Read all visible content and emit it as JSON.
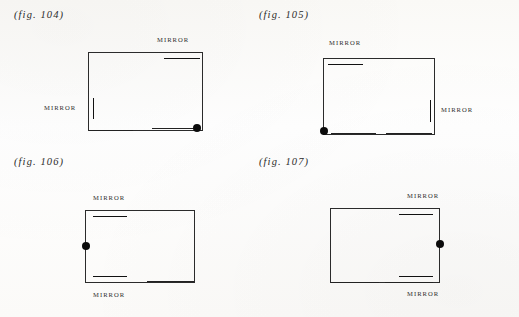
{
  "page": {
    "background_color": "#fdfdfc",
    "ink_color": "#1a1a1a"
  },
  "figures": [
    {
      "id": "fig-104",
      "label": "(fig. 104)",
      "mirrors": [
        {
          "label": "MIRROR",
          "wall": "top",
          "side": "right"
        },
        {
          "label": "MIRROR",
          "wall": "left",
          "side": "middle"
        }
      ],
      "dot": {
        "position": "bottom-right-corner"
      }
    },
    {
      "id": "fig-105",
      "label": "(fig. 105)",
      "mirrors": [
        {
          "label": "MIRROR",
          "wall": "top",
          "side": "left"
        },
        {
          "label": "MIRROR",
          "wall": "right",
          "side": "middle"
        }
      ],
      "dot": {
        "position": "bottom-left-corner"
      }
    },
    {
      "id": "fig-106",
      "label": "(fig. 106)",
      "mirrors": [
        {
          "label": "MIRROR",
          "wall": "top",
          "side": "left"
        },
        {
          "label": "MIRROR",
          "wall": "bottom",
          "side": "left"
        }
      ],
      "dot": {
        "position": "left-wall-middle"
      }
    },
    {
      "id": "fig-107",
      "label": "(fig. 107)",
      "mirrors": [
        {
          "label": "MIRROR",
          "wall": "top",
          "side": "right"
        },
        {
          "label": "MIRROR",
          "wall": "bottom",
          "side": "right"
        }
      ],
      "dot": {
        "position": "right-wall-middle"
      }
    }
  ]
}
